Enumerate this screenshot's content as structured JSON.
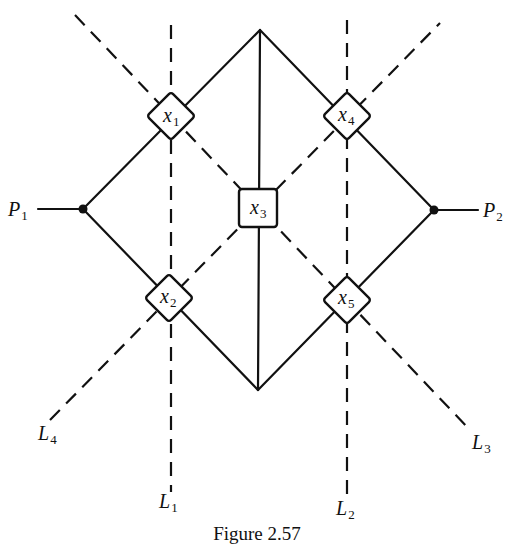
{
  "figure": {
    "caption": "Figure 2.57",
    "ports": [
      {
        "id": "P1",
        "letter": "P",
        "sub": "1"
      },
      {
        "id": "P2",
        "letter": "P",
        "sub": "2"
      }
    ],
    "nodes": [
      {
        "id": "x1",
        "letter": "x",
        "sub": "1",
        "shape": "diamond"
      },
      {
        "id": "x2",
        "letter": "x",
        "sub": "2",
        "shape": "diamond"
      },
      {
        "id": "x3",
        "letter": "x",
        "sub": "3",
        "shape": "square"
      },
      {
        "id": "x4",
        "letter": "x",
        "sub": "4",
        "shape": "diamond"
      },
      {
        "id": "x5",
        "letter": "x",
        "sub": "5",
        "shape": "diamond"
      }
    ],
    "lines": [
      {
        "id": "L1",
        "letter": "L",
        "sub": "1",
        "style": "dashed"
      },
      {
        "id": "L2",
        "letter": "L",
        "sub": "2",
        "style": "dashed"
      },
      {
        "id": "L3",
        "letter": "L",
        "sub": "3",
        "style": "dashed"
      },
      {
        "id": "L4",
        "letter": "L",
        "sub": "4",
        "style": "dashed"
      }
    ],
    "stroke_color": "#111111",
    "background": "#ffffff"
  }
}
